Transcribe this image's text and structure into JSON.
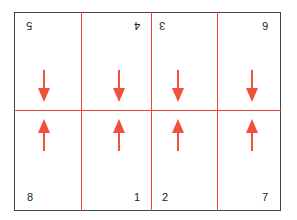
{
  "diagram": {
    "colors": {
      "border": "#444444",
      "fold_line": "#e8453c",
      "arrow": "#f0503c",
      "text": "#222222"
    },
    "top_row": [
      {
        "page": "5",
        "orientation": "upside-down"
      },
      {
        "page": "4",
        "orientation": "upside-down"
      },
      {
        "page": "3",
        "orientation": "upside-down"
      },
      {
        "page": "6",
        "orientation": "upside-down"
      }
    ],
    "bottom_row": [
      {
        "page": "8",
        "orientation": "upright"
      },
      {
        "page": "1",
        "orientation": "upright"
      },
      {
        "page": "2",
        "orientation": "upright"
      },
      {
        "page": "7",
        "orientation": "upright"
      }
    ],
    "arrows": {
      "top_row": "down",
      "bottom_row": "up"
    }
  }
}
